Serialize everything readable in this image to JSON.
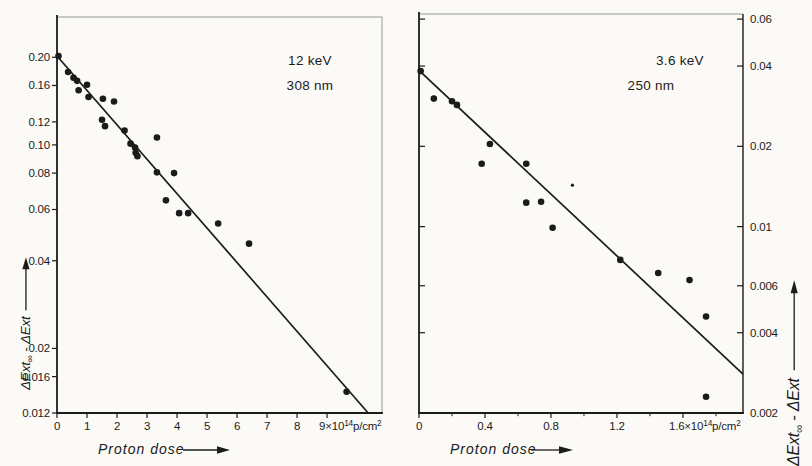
{
  "figure": {
    "background": "#fbfaf7",
    "ink": "#1b1b1b",
    "frame_light": "#979797"
  },
  "chart_data": [
    {
      "type": "scatter",
      "panel": "left",
      "annotation_lines": [
        "12 keV",
        "308 nm"
      ],
      "xlabel": "Proton dose",
      "ylabel": "ΔExt_{∞} - ΔExt",
      "x_axis": {
        "scale": "linear",
        "min": 0,
        "max": 10.83,
        "ticks": [
          0,
          1,
          2,
          3,
          4,
          5,
          6,
          7,
          8,
          9
        ],
        "tick_labels": [
          "0",
          "1",
          "2",
          "3",
          "4",
          "5",
          "6",
          "7",
          "8",
          "9×10^{14}p/cm^{2}"
        ],
        "minor_ticks": []
      },
      "y_axis": {
        "scale": "log",
        "side": "left",
        "min": 0.012,
        "max": 0.275,
        "ticks": [
          0.2,
          0.16,
          0.12,
          0.1,
          0.08,
          0.06,
          0.04,
          0.02,
          0.016,
          0.012
        ],
        "tick_labels": [
          "0.20",
          "0.16",
          "0.12",
          "0.10",
          "0.08",
          "0.06",
          "0.04",
          "0.02",
          "0.016",
          "0.012"
        ]
      },
      "fit_line": {
        "x": [
          0,
          10.37
        ],
        "y": [
          0.202,
          0.012
        ]
      },
      "points": [
        [
          0.05,
          0.202
        ],
        [
          0.37,
          0.178
        ],
        [
          0.55,
          0.17
        ],
        [
          0.67,
          0.166
        ],
        [
          0.72,
          0.154
        ],
        [
          1.0,
          0.161
        ],
        [
          1.05,
          0.146
        ],
        [
          1.53,
          0.144
        ],
        [
          1.9,
          0.141
        ],
        [
          1.5,
          0.122
        ],
        [
          1.6,
          0.116
        ],
        [
          2.25,
          0.112
        ],
        [
          2.45,
          0.101
        ],
        [
          2.6,
          0.098
        ],
        [
          2.62,
          0.094
        ],
        [
          2.68,
          0.0915
        ],
        [
          3.33,
          0.106
        ],
        [
          3.33,
          0.0805
        ],
        [
          3.9,
          0.08
        ],
        [
          3.63,
          0.0645
        ],
        [
          4.07,
          0.0583
        ],
        [
          4.37,
          0.0583
        ],
        [
          5.37,
          0.0537
        ],
        [
          6.4,
          0.0458
        ],
        [
          9.65,
          0.0142
        ]
      ],
      "small_points": []
    },
    {
      "type": "scatter",
      "panel": "right",
      "annotation_lines": [
        "3.6 keV",
        "250 nm"
      ],
      "xlabel": "Proton dose",
      "ylabel": "ΔExt_{∞} - ΔExt",
      "x_axis": {
        "scale": "linear",
        "min": 0,
        "max": 1.964,
        "ticks": [
          0,
          0.4,
          0.8,
          1.2,
          1.6
        ],
        "tick_labels": [
          "0",
          "0.4",
          "0.8",
          "1.2",
          "1.6×10^{14}p/cm^{2}"
        ],
        "minor_ticks": [
          0.2,
          0.6,
          1.0,
          1.4,
          1.8
        ]
      },
      "y_axis": {
        "scale": "log",
        "side": "right",
        "min": 0.002,
        "max": 0.0627,
        "ticks": [
          0.06,
          0.04,
          0.02,
          0.01,
          0.006,
          0.004,
          0.002
        ],
        "tick_labels": [
          "0.06",
          "0.04",
          "0.02",
          "0.01",
          "0.006",
          "0.004",
          "0.002"
        ]
      },
      "fit_line": {
        "x": [
          0,
          1.964
        ],
        "y": [
          0.0385,
          0.0028
        ]
      },
      "points": [
        [
          0.01,
          0.0383
        ],
        [
          0.09,
          0.0302
        ],
        [
          0.2,
          0.0295
        ],
        [
          0.23,
          0.0286
        ],
        [
          0.43,
          0.0204
        ],
        [
          0.38,
          0.0172
        ],
        [
          0.65,
          0.0172
        ],
        [
          0.65,
          0.0123
        ],
        [
          0.74,
          0.0124
        ],
        [
          0.81,
          0.0099
        ],
        [
          1.22,
          0.0075
        ],
        [
          1.45,
          0.0067
        ],
        [
          1.64,
          0.0063
        ],
        [
          1.74,
          0.0046
        ],
        [
          1.74,
          0.0023
        ]
      ],
      "small_points": [
        [
          0.93,
          0.0143
        ]
      ]
    }
  ]
}
